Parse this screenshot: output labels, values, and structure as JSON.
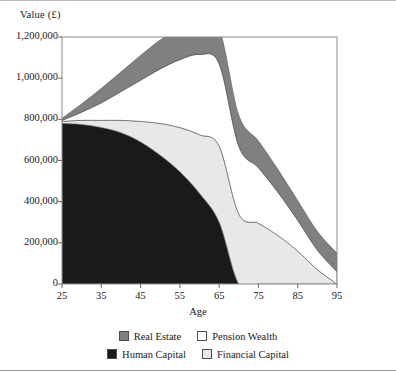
{
  "chart_data": {
    "type": "area",
    "title": "",
    "subtitle": "",
    "xlabel": "Age",
    "ylabel": "Value (£)",
    "stacked": true,
    "grid": false,
    "legend_position": "bottom",
    "xlim": [
      25,
      95
    ],
    "ylim": [
      0,
      1200000
    ],
    "xticks": [
      25,
      35,
      45,
      55,
      65,
      75,
      85,
      95
    ],
    "xtick_labels": [
      "25",
      "35",
      "45",
      "55",
      "65",
      "75",
      "85",
      "95"
    ],
    "yticks": [
      0,
      200000,
      400000,
      600000,
      800000,
      1000000,
      1200000
    ],
    "ytick_labels": [
      "0",
      "200,000",
      "400,000",
      "600,000",
      "800,000",
      "1,000,000",
      "1,200,000"
    ],
    "x": [
      25,
      30,
      35,
      40,
      45,
      50,
      55,
      60,
      65,
      70,
      75,
      80,
      85,
      90,
      95
    ],
    "series": [
      {
        "name": "Human Capital",
        "color": "#1a1a1a",
        "values": [
          780000,
          775000,
          760000,
          735000,
          690000,
          625000,
          545000,
          440000,
          300000,
          0,
          0,
          0,
          0,
          0,
          0
        ]
      },
      {
        "name": "Financial Capital",
        "color": "#e8e8e8",
        "values": [
          10000,
          20000,
          35000,
          60000,
          100000,
          155000,
          215000,
          285000,
          370000,
          340000,
          295000,
          235000,
          160000,
          70000,
          0
        ]
      },
      {
        "name": "Pension Wealth",
        "color": "#ffffff",
        "values": [
          5000,
          40000,
          85000,
          140000,
          200000,
          265000,
          330000,
          390000,
          400000,
          330000,
          270000,
          210000,
          150000,
          95000,
          60000
        ]
      },
      {
        "name": "Real Estate",
        "color": "#808080",
        "values": [
          10000,
          40000,
          70000,
          95000,
          120000,
          140000,
          155000,
          165000,
          170000,
          150000,
          130000,
          110000,
          95000,
          90000,
          90000
        ]
      }
    ],
    "totals": [
      805000,
      875000,
      950000,
      1030000,
      1110000,
      1185000,
      1245000,
      1280000,
      1240000,
      820000,
      695000,
      555000,
      405000,
      255000,
      150000
    ]
  },
  "legend": {
    "items": [
      {
        "label": "Real Estate",
        "color": "#808080"
      },
      {
        "label": "Pension Wealth",
        "color": "#ffffff"
      },
      {
        "label": "Human Capital",
        "color": "#1a1a1a"
      },
      {
        "label": "Financial Capital",
        "color": "#e8e8e8"
      }
    ]
  },
  "axes": {
    "y_title": "Value (£)",
    "x_title": "Age"
  }
}
